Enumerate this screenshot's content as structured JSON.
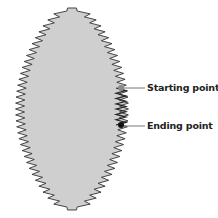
{
  "diagram": {
    "shape": "zigzag-lens",
    "fill_color": "#cfcfcf",
    "stroke_color": "#333333",
    "labels": [
      {
        "text": "Starting point",
        "marker_color": "#888888"
      },
      {
        "text": "Ending point",
        "marker_color": "#111111"
      }
    ]
  }
}
